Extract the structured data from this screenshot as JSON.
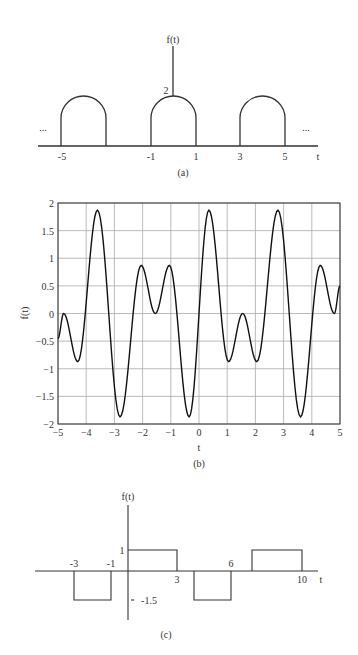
{
  "chart_data": [
    {
      "id": "a",
      "type": "line",
      "caption": "(a)",
      "title": "",
      "xlabel": "t",
      "ylabel": "f(t)",
      "description": "Periodic train of semicircle-topped pulses of height 2, width 2, period 4",
      "x_tick_labels": [
        "-5",
        "-1",
        "1",
        "3",
        "5"
      ],
      "y_tick_labels": [
        "2"
      ],
      "ellipsis_left": "...",
      "ellipsis_right": "...",
      "pulses": [
        {
          "start": -5,
          "end": -3,
          "height": 2
        },
        {
          "start": -1,
          "end": 1,
          "height": 2
        },
        {
          "start": 3,
          "end": 5,
          "height": 2
        }
      ],
      "grid": false
    },
    {
      "id": "b",
      "type": "line",
      "caption": "(b)",
      "title": "",
      "xlabel": "t",
      "ylabel": "f(t)",
      "xlim": [
        -5,
        5
      ],
      "ylim": [
        -2,
        2
      ],
      "x_ticks": [
        -5,
        -4,
        -3,
        -2,
        -1,
        0,
        1,
        2,
        3,
        4,
        5
      ],
      "x_tick_labels": [
        "-5",
        "-4",
        "-3",
        "-2",
        "-1",
        "0",
        "1",
        "2",
        "3",
        "4",
        "5"
      ],
      "y_ticks": [
        2,
        1.5,
        1,
        0.5,
        0,
        -0.5,
        -1,
        -1.5,
        -2
      ],
      "y_tick_labels": [
        "2",
        "1.5",
        "1",
        "0.5",
        "0",
        "-0.5",
        "-1",
        "-1.5",
        "-2"
      ],
      "grid": true,
      "x": [
        -5,
        -4.8,
        -4.3,
        -3.6,
        -2.8,
        -2.05,
        -1.55,
        -1.05,
        -0.35,
        0.35,
        1.05,
        1.55,
        2.05,
        2.8,
        3.6,
        4.3,
        4.8,
        5
      ],
      "y": [
        -0.45,
        0,
        -0.87,
        1.87,
        -1.87,
        0.87,
        0,
        0.87,
        -1.87,
        1.87,
        -0.87,
        0,
        -0.87,
        1.87,
        -1.87,
        0.87,
        0,
        0.5
      ]
    },
    {
      "id": "c",
      "type": "line",
      "caption": "(c)",
      "title": "",
      "xlabel": "t",
      "ylabel": "f(t)",
      "x_tick_labels": [
        "-3",
        "-1",
        "3",
        "6",
        "10"
      ],
      "y_tick_labels": [
        "1",
        "-1.5"
      ],
      "segments": [
        {
          "start": -3,
          "end": -1,
          "value": -1.5
        },
        {
          "start": 0,
          "end": 3,
          "value": 1
        },
        {
          "start": 3.8,
          "end": 6,
          "value": -1.5
        },
        {
          "start": 7.2,
          "end": 10,
          "value": 1
        }
      ],
      "grid": false
    }
  ]
}
